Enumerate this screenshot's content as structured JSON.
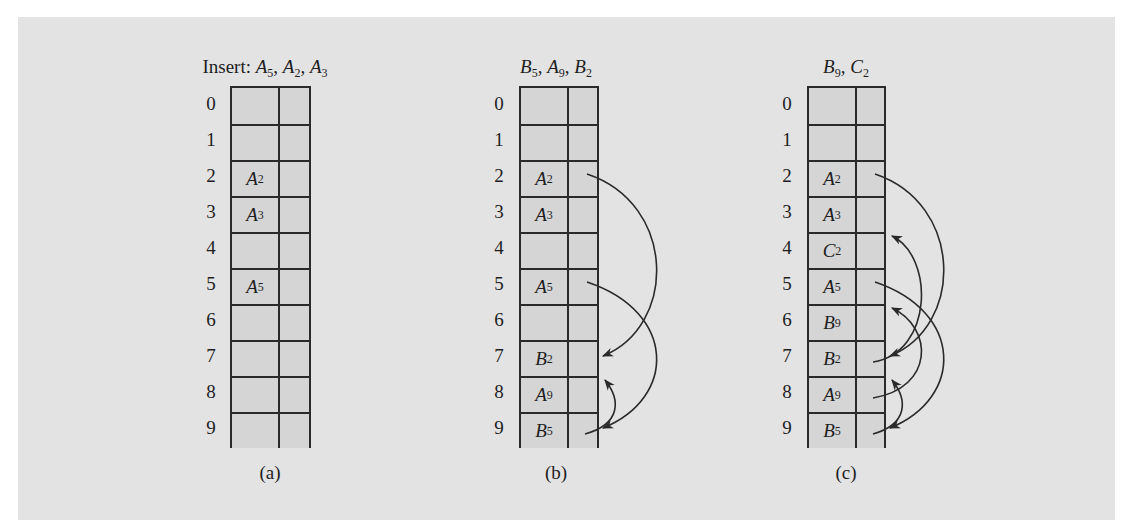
{
  "panels": [
    {
      "id": "a",
      "title_prefix": "Insert: ",
      "title_keys": [
        {
          "letter": "A",
          "sub": "5"
        },
        {
          "letter": "A",
          "sub": "2"
        },
        {
          "letter": "A",
          "sub": "3"
        }
      ],
      "caption": "(a)",
      "slots": [
        {
          "index": "0",
          "letter": "",
          "sub": ""
        },
        {
          "index": "1",
          "letter": "",
          "sub": ""
        },
        {
          "index": "2",
          "letter": "A",
          "sub": "2"
        },
        {
          "index": "3",
          "letter": "A",
          "sub": "3"
        },
        {
          "index": "4",
          "letter": "",
          "sub": ""
        },
        {
          "index": "5",
          "letter": "A",
          "sub": "5"
        },
        {
          "index": "6",
          "letter": "",
          "sub": ""
        },
        {
          "index": "7",
          "letter": "",
          "sub": ""
        },
        {
          "index": "8",
          "letter": "",
          "sub": ""
        },
        {
          "index": "9",
          "letter": "",
          "sub": ""
        }
      ],
      "links": []
    },
    {
      "id": "b",
      "title_prefix": "",
      "title_keys": [
        {
          "letter": "B",
          "sub": "5"
        },
        {
          "letter": "A",
          "sub": "9"
        },
        {
          "letter": "B",
          "sub": "2"
        }
      ],
      "caption": "(b)",
      "slots": [
        {
          "index": "0",
          "letter": "",
          "sub": ""
        },
        {
          "index": "1",
          "letter": "",
          "sub": ""
        },
        {
          "index": "2",
          "letter": "A",
          "sub": "2"
        },
        {
          "index": "3",
          "letter": "A",
          "sub": "3"
        },
        {
          "index": "4",
          "letter": "",
          "sub": ""
        },
        {
          "index": "5",
          "letter": "A",
          "sub": "5"
        },
        {
          "index": "6",
          "letter": "",
          "sub": ""
        },
        {
          "index": "7",
          "letter": "B",
          "sub": "2"
        },
        {
          "index": "8",
          "letter": "A",
          "sub": "9"
        },
        {
          "index": "9",
          "letter": "B",
          "sub": "5"
        }
      ],
      "links": [
        {
          "from": 2,
          "to": 7
        },
        {
          "from": 5,
          "to": 9
        },
        {
          "from": 9,
          "to": 8
        }
      ]
    },
    {
      "id": "c",
      "title_prefix": "",
      "title_keys": [
        {
          "letter": "B",
          "sub": "9"
        },
        {
          "letter": "C",
          "sub": "2"
        }
      ],
      "caption": "(c)",
      "slots": [
        {
          "index": "0",
          "letter": "",
          "sub": ""
        },
        {
          "index": "1",
          "letter": "",
          "sub": ""
        },
        {
          "index": "2",
          "letter": "A",
          "sub": "2"
        },
        {
          "index": "3",
          "letter": "A",
          "sub": "3"
        },
        {
          "index": "4",
          "letter": "C",
          "sub": "2"
        },
        {
          "index": "5",
          "letter": "A",
          "sub": "5"
        },
        {
          "index": "6",
          "letter": "B",
          "sub": "9"
        },
        {
          "index": "7",
          "letter": "B",
          "sub": "2"
        },
        {
          "index": "8",
          "letter": "A",
          "sub": "9"
        },
        {
          "index": "9",
          "letter": "B",
          "sub": "5"
        }
      ],
      "links": [
        {
          "from": 2,
          "to": 7
        },
        {
          "from": 5,
          "to": 9
        },
        {
          "from": 9,
          "to": 8
        },
        {
          "from": 7,
          "to": 4
        },
        {
          "from": 8,
          "to": 6
        }
      ]
    }
  ],
  "colors": {
    "panel_bg": "#e3e3e3",
    "cell_bg": "#d5d5d5",
    "line": "#2a2a2a"
  }
}
